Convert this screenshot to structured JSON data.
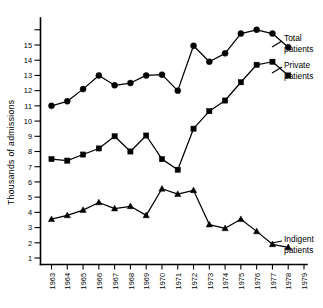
{
  "chart_data": {
    "type": "line",
    "title": "",
    "xlabel": "",
    "ylabel": "Thousands of admissions",
    "x": [
      1963,
      1964,
      1965,
      1966,
      1967,
      1968,
      1969,
      1970,
      1971,
      1972,
      1973,
      1974,
      1975,
      1976,
      1977,
      1978
    ],
    "xtick_labels": [
      "1963",
      "1964",
      "1965",
      "1966",
      "1967",
      "1968",
      "1969",
      "1970",
      "1971",
      "1972",
      "1973",
      "1974",
      "1975",
      "1976",
      "1977",
      "1978",
      "1979"
    ],
    "xlim": [
      1963,
      1979
    ],
    "ylim": [
      0,
      16
    ],
    "ytick_values": [
      1,
      2,
      3,
      4,
      5,
      6,
      7,
      8,
      9,
      10,
      11,
      12,
      13,
      14,
      15,
      16
    ],
    "ytick_labels": [
      "1",
      "2",
      "3",
      "4",
      "5",
      "6",
      "7",
      "8",
      "9",
      "10",
      "11",
      "12",
      "13",
      "14",
      "15",
      ""
    ],
    "grid": false,
    "legend_position": "right-inline-annotations",
    "series": [
      {
        "name": "Total patients",
        "label_line1": "Total",
        "label_line2": "patients",
        "marker": "circle",
        "color": "#000000",
        "values": [
          11.0,
          11.3,
          12.1,
          13.0,
          12.35,
          12.5,
          13.0,
          13.05,
          12.0,
          14.95,
          13.9,
          14.45,
          15.75,
          16.0,
          15.75,
          14.85
        ]
      },
      {
        "name": "Private patients",
        "label_line1": "Private",
        "label_line2": "patients",
        "marker": "square",
        "color": "#000000",
        "values": [
          7.5,
          7.4,
          7.8,
          8.2,
          9.0,
          8.0,
          9.05,
          7.5,
          6.8,
          9.5,
          10.65,
          11.35,
          12.55,
          13.7,
          13.9,
          13.0
        ]
      },
      {
        "name": "Indigent patients",
        "label_line1": "Indigent",
        "label_line2": "patients",
        "marker": "triangle",
        "color": "#000000",
        "values": [
          3.55,
          3.8,
          4.15,
          4.65,
          4.25,
          4.4,
          3.8,
          5.55,
          5.2,
          5.45,
          3.2,
          2.95,
          3.55,
          2.75,
          1.9,
          1.7
        ]
      }
    ]
  },
  "axis": {
    "y_title": "Thousands of admissions"
  },
  "annotations": {
    "total": {
      "line1": "Total",
      "line2": "patients"
    },
    "private": {
      "line1": "Private",
      "line2": "patients"
    },
    "indigent": {
      "line1": "Indigent",
      "line2": "patients"
    }
  }
}
